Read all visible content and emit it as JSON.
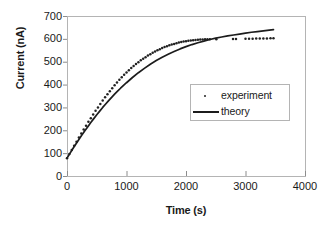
{
  "chart_data": {
    "type": "scatter",
    "title": "",
    "xlabel": "Time (s)",
    "ylabel": "Current (nA)",
    "xlim": [
      0,
      4000
    ],
    "ylim": [
      0,
      700
    ],
    "xticks": [
      0,
      1000,
      2000,
      3000,
      4000
    ],
    "yticks": [
      0,
      100,
      200,
      300,
      400,
      500,
      600,
      700
    ],
    "xtick_labels": [
      "0",
      "1000",
      "2000",
      "3000",
      "4000"
    ],
    "ytick_labels": [
      "0",
      "100",
      "200",
      "300",
      "400",
      "500",
      "600",
      "700"
    ],
    "grid": false,
    "legend_position": "center-right",
    "frame_color": "#b4b4b4",
    "series": [
      {
        "name": "experiment",
        "marker": "dot",
        "color": "#222222",
        "x": [
          0,
          40,
          80,
          120,
          160,
          200,
          240,
          280,
          320,
          360,
          400,
          440,
          480,
          520,
          560,
          600,
          640,
          680,
          720,
          760,
          800,
          840,
          880,
          920,
          960,
          1000,
          1040,
          1080,
          1120,
          1160,
          1200,
          1240,
          1280,
          1320,
          1360,
          1400,
          1440,
          1480,
          1520,
          1560,
          1600,
          1640,
          1680,
          1720,
          1760,
          1800,
          1840,
          1880,
          1920,
          1960,
          2000,
          2040,
          2080,
          2120,
          2160,
          2200,
          2240,
          2280,
          2320,
          2360,
          2400,
          2510,
          2790,
          2840,
          3000,
          3060,
          3120,
          3180,
          3240,
          3300,
          3360,
          3420,
          3470
        ],
        "y": [
          78,
          96,
          114,
          132,
          150,
          168,
          186,
          203,
          220,
          237,
          253,
          269,
          285,
          300,
          315,
          330,
          344,
          358,
          371,
          384,
          397,
          409,
          421,
          432,
          443,
          453,
          463,
          472,
          481,
          490,
          498,
          506,
          513,
          520,
          527,
          533,
          539,
          545,
          550,
          555,
          560,
          564,
          568,
          572,
          575,
          578,
          581,
          584,
          586,
          588,
          590,
          592,
          593,
          594,
          595,
          596,
          597,
          597,
          598,
          598,
          598,
          598,
          599,
          599,
          601,
          601,
          601,
          602,
          602,
          602,
          602,
          603,
          603
        ]
      },
      {
        "name": "theory",
        "marker": "line",
        "color": "#1c1c1c",
        "x": [
          0,
          50,
          100,
          150,
          200,
          250,
          300,
          350,
          400,
          450,
          500,
          550,
          600,
          650,
          700,
          750,
          800,
          850,
          900,
          950,
          1000,
          1100,
          1200,
          1300,
          1400,
          1500,
          1600,
          1700,
          1800,
          1900,
          2000,
          2100,
          2200,
          2300,
          2400,
          2500,
          2600,
          2700,
          2800,
          2900,
          3000,
          3100,
          3200,
          3300,
          3400,
          3470
        ],
        "y": [
          78,
          99,
          120,
          140,
          160,
          179,
          198,
          216,
          234,
          251,
          268,
          284,
          300,
          315,
          330,
          344,
          358,
          371,
          384,
          396,
          408,
          431,
          452,
          471,
          489,
          505,
          520,
          533,
          545,
          556,
          566,
          575,
          583,
          590,
          597,
          603,
          608,
          613,
          617,
          621,
          625,
          629,
          632,
          635,
          638,
          640
        ]
      }
    ]
  },
  "legend": {
    "entries": [
      {
        "label": "experiment"
      },
      {
        "label": "theory"
      }
    ]
  }
}
